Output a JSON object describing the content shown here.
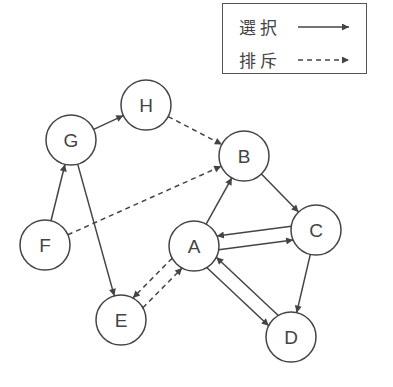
{
  "legend": {
    "items": [
      {
        "label": "選択",
        "style": "solid"
      },
      {
        "label": "排斥",
        "style": "dashed"
      }
    ]
  },
  "colors": {
    "stroke": "#444444",
    "background": "#ffffff"
  },
  "nodes": [
    {
      "id": "A",
      "label": "A",
      "x": 194,
      "y": 246
    },
    {
      "id": "B",
      "label": "B",
      "x": 244,
      "y": 156
    },
    {
      "id": "C",
      "label": "C",
      "x": 316,
      "y": 230
    },
    {
      "id": "D",
      "label": "D",
      "x": 291,
      "y": 337
    },
    {
      "id": "E",
      "label": "E",
      "x": 121,
      "y": 320
    },
    {
      "id": "F",
      "label": "F",
      "x": 45,
      "y": 245
    },
    {
      "id": "G",
      "label": "G",
      "x": 71,
      "y": 140
    },
    {
      "id": "H",
      "label": "H",
      "x": 146,
      "y": 105
    }
  ],
  "edges": [
    {
      "from": "G",
      "to": "H",
      "type": "選択"
    },
    {
      "from": "H",
      "to": "B",
      "type": "排斥"
    },
    {
      "from": "F",
      "to": "G",
      "type": "選択"
    },
    {
      "from": "G",
      "to": "E",
      "type": "選択"
    },
    {
      "from": "F",
      "to": "B",
      "type": "排斥"
    },
    {
      "from": "A",
      "to": "B",
      "type": "選択"
    },
    {
      "from": "B",
      "to": "C",
      "type": "選択"
    },
    {
      "from": "A",
      "to": "C",
      "type": "選択"
    },
    {
      "from": "C",
      "to": "A",
      "type": "選択"
    },
    {
      "from": "C",
      "to": "D",
      "type": "選択"
    },
    {
      "from": "A",
      "to": "D",
      "type": "選択"
    },
    {
      "from": "D",
      "to": "A",
      "type": "選択"
    },
    {
      "from": "A",
      "to": "E",
      "type": "排斥"
    },
    {
      "from": "E",
      "to": "A",
      "type": "排斥"
    }
  ]
}
